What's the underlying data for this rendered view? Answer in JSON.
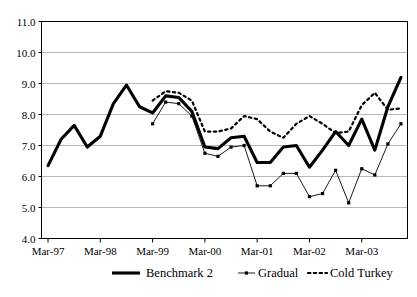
{
  "chart_data": {
    "type": "line",
    "title": "",
    "xlabel": "",
    "ylabel": "",
    "ylim": [
      4.0,
      11.0
    ],
    "y_ticks": [
      "4.0",
      "5.0",
      "6.0",
      "7.0",
      "8.0",
      "9.0",
      "10.0",
      "11.0"
    ],
    "y_tick_values": [
      4.0,
      5.0,
      6.0,
      7.0,
      8.0,
      9.0,
      10.0,
      11.0
    ],
    "x_tick_labels": [
      "Mar-97",
      "Mar-98",
      "Mar-99",
      "Mar-00",
      "Mar-01",
      "Mar-02",
      "Mar-03"
    ],
    "x_tick_indices": [
      0,
      4,
      8,
      12,
      16,
      20,
      24
    ],
    "grid": true,
    "legend_position": "bottom",
    "x": [
      "Mar-97",
      "Jun-97",
      "Sep-97",
      "Dec-97",
      "Mar-98",
      "Jun-98",
      "Sep-98",
      "Dec-98",
      "Mar-99",
      "Jun-99",
      "Sep-99",
      "Dec-99",
      "Mar-00",
      "Jun-00",
      "Sep-00",
      "Dec-00",
      "Mar-01",
      "Jun-01",
      "Sep-01",
      "Dec-01",
      "Mar-02",
      "Jun-02",
      "Sep-02",
      "Dec-02",
      "Mar-03",
      "Jun-03",
      "Sep-03",
      "Dec-03"
    ],
    "series": [
      {
        "name": "Benchmark 2",
        "style": "thick-solid",
        "color": "#000000",
        "values": [
          6.35,
          7.2,
          7.65,
          6.95,
          7.3,
          8.35,
          8.95,
          8.25,
          8.05,
          8.6,
          8.55,
          8.1,
          6.95,
          6.9,
          7.25,
          7.3,
          6.45,
          6.45,
          6.95,
          7.0,
          6.3,
          6.85,
          7.45,
          7.0,
          7.85,
          6.85,
          8.25,
          9.2
        ]
      },
      {
        "name": "Gradual",
        "style": "thin-marker",
        "color": "#000000",
        "values": [
          null,
          null,
          null,
          null,
          null,
          null,
          null,
          null,
          7.7,
          8.4,
          8.35,
          7.95,
          6.75,
          6.65,
          6.95,
          7.0,
          5.7,
          5.7,
          6.1,
          6.1,
          5.35,
          5.45,
          6.2,
          5.15,
          6.25,
          6.05,
          7.05,
          7.7
        ]
      },
      {
        "name": "Cold Turkey",
        "style": "dotted",
        "color": "#000000",
        "values": [
          null,
          null,
          null,
          null,
          null,
          null,
          null,
          null,
          8.45,
          8.75,
          8.7,
          8.45,
          7.45,
          7.45,
          7.55,
          7.95,
          7.85,
          7.45,
          7.25,
          7.7,
          7.95,
          7.7,
          7.4,
          7.45,
          8.3,
          8.7,
          8.15,
          8.2
        ]
      }
    ],
    "legend": [
      {
        "label": "Benchmark 2",
        "marker": "thick-solid"
      },
      {
        "label": "Gradual",
        "marker": "thin-marker"
      },
      {
        "label": "Cold Turkey",
        "marker": "dotted"
      }
    ]
  }
}
